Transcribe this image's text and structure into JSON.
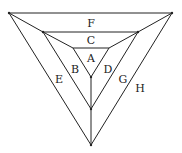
{
  "diagram": {
    "title": "",
    "labels": [
      {
        "id": "F",
        "text": "F",
        "x": 91,
        "y": 24
      },
      {
        "id": "C",
        "text": "C",
        "x": 91,
        "y": 41
      },
      {
        "id": "A",
        "text": "A",
        "x": 91,
        "y": 59
      },
      {
        "id": "B",
        "text": "B",
        "x": 75,
        "y": 70
      },
      {
        "id": "D",
        "text": "D",
        "x": 108,
        "y": 70
      },
      {
        "id": "E",
        "text": "E",
        "x": 59,
        "y": 80
      },
      {
        "id": "G",
        "text": "G",
        "x": 123,
        "y": 80
      },
      {
        "id": "H",
        "text": "H",
        "x": 140,
        "y": 89
      }
    ],
    "triangles": {
      "outer": [
        [
          9,
          13
        ],
        [
          172,
          13
        ],
        [
          91,
          145
        ]
      ],
      "middle": [
        [
          43,
          32
        ],
        [
          138,
          32
        ],
        [
          91,
          109
        ]
      ],
      "inner": [
        [
          73,
          48
        ],
        [
          109,
          48
        ],
        [
          91,
          77
        ]
      ]
    },
    "connectors": [
      [
        [
          9,
          13
        ],
        [
          43,
          32
        ]
      ],
      [
        [
          43,
          32
        ],
        [
          73,
          48
        ]
      ],
      [
        [
          172,
          13
        ],
        [
          138,
          32
        ]
      ],
      [
        [
          138,
          32
        ],
        [
          109,
          48
        ]
      ],
      [
        [
          91,
          77
        ],
        [
          91,
          145
        ]
      ]
    ],
    "stroke_color": "#222222"
  }
}
